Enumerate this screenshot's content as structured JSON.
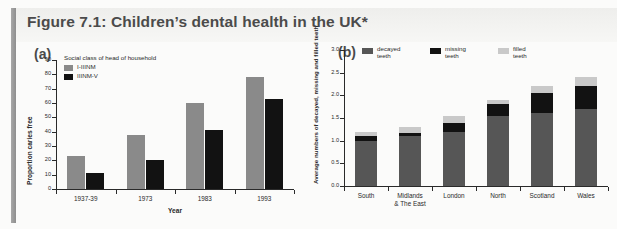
{
  "figure": {
    "title": "Figure 7.1: Children’s dental health in the UK*",
    "panel_a_letter": "(a)",
    "panel_b_letter": "(b)"
  },
  "colors": {
    "grey_light": "#c9c9c9",
    "grey_mid": "#8a8a8a",
    "grey_dark": "#565656",
    "black": "#121212",
    "axis": "#2a2a2a",
    "header_band": "#eeeeec",
    "accent": "#9a9a9a",
    "background": "#fbfbfa"
  },
  "chart_data": [
    {
      "type": "bar",
      "panel": "(a)",
      "title": "",
      "xlabel": "Year",
      "ylabel": "Proportion caries free",
      "ylim": [
        0,
        90
      ],
      "yticks": [
        0,
        10,
        20,
        30,
        40,
        50,
        60,
        70,
        80,
        90
      ],
      "ytick_labels": [
        "0",
        "10",
        "20",
        "30",
        "40",
        "50",
        "60",
        "70",
        "80",
        "90"
      ],
      "grid": false,
      "legend_title": "Social class of head of household",
      "legend_position": "top-left inside",
      "categories": [
        "1937-39",
        "1973",
        "1983",
        "1993"
      ],
      "series": [
        {
          "name": "I-IIINM",
          "color": "#8a8a8a",
          "values": [
            23,
            38,
            60,
            78
          ]
        },
        {
          "name": "IIINM-V",
          "color": "#121212",
          "values": [
            11,
            20,
            41,
            63
          ]
        }
      ]
    },
    {
      "type": "bar",
      "subtype": "stacked",
      "panel": "(b)",
      "title": "",
      "xlabel": "",
      "ylabel": "Average numbers of decayed, missing and filled teeth",
      "ylim": [
        0.0,
        3.0
      ],
      "yticks": [
        0.0,
        0.5,
        1.0,
        1.5,
        2.0,
        2.5,
        3.0
      ],
      "ytick_labels": [
        "0.0",
        "0.5",
        "1.0",
        "1.5",
        "2.0",
        "2.5",
        "3.0"
      ],
      "grid": false,
      "legend_position": "top inside",
      "categories": [
        "South",
        "Midlands & The East",
        "London",
        "North",
        "Scotland",
        "Wales"
      ],
      "category_lines": [
        [
          "South"
        ],
        [
          "Midlands",
          "& The East"
        ],
        [
          "London"
        ],
        [
          "North"
        ],
        [
          "Scotland"
        ],
        [
          "Wales"
        ]
      ],
      "series": [
        {
          "name": "decayed teeth",
          "color": "#565656",
          "values": [
            1.0,
            1.1,
            1.2,
            1.55,
            1.6,
            1.7
          ]
        },
        {
          "name": "missing teeth",
          "color": "#121212",
          "values": [
            0.1,
            0.08,
            0.2,
            0.25,
            0.45,
            0.5
          ]
        },
        {
          "name": "filled teeth",
          "color": "#c9c9c9",
          "values": [
            0.1,
            0.12,
            0.15,
            0.1,
            0.15,
            0.2
          ]
        }
      ],
      "totals": [
        1.2,
        1.3,
        1.55,
        1.9,
        2.2,
        2.4
      ]
    }
  ]
}
